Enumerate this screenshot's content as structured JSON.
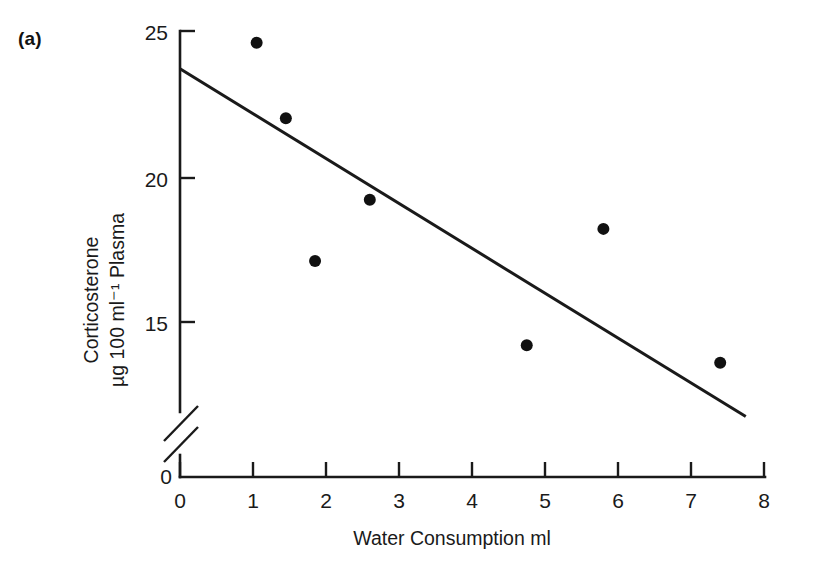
{
  "figure": {
    "panel_label": "(a)",
    "background_color": "#ffffff",
    "ink_color": "#1a1a1a"
  },
  "chart_data": {
    "type": "scatter",
    "title": "",
    "xlabel": "Water Consumption ml",
    "ylabel_line1": "Corticosterone",
    "ylabel_line2": "µg 100 ml⁻¹ Plasma",
    "xlim": [
      0,
      8
    ],
    "ylim": [
      0,
      25
    ],
    "y_axis_break": true,
    "y_break_between": [
      0,
      13
    ],
    "grid": false,
    "legend": null,
    "xticks": [
      0,
      1,
      2,
      3,
      4,
      5,
      6,
      7,
      8
    ],
    "xtick_labels": [
      "0",
      "1",
      "2",
      "3",
      "4",
      "5",
      "6",
      "7",
      "8"
    ],
    "yticks": [
      0,
      15,
      20,
      25
    ],
    "ytick_labels": [
      "0",
      "15",
      "20",
      "25"
    ],
    "x": [
      1.05,
      1.45,
      1.85,
      2.6,
      4.75,
      5.8,
      7.4
    ],
    "y": [
      24.6,
      22.0,
      17.1,
      19.2,
      14.2,
      18.2,
      13.6
    ],
    "points": [
      {
        "x": 1.05,
        "y": 24.6
      },
      {
        "x": 1.45,
        "y": 22.0
      },
      {
        "x": 1.85,
        "y": 17.1
      },
      {
        "x": 2.6,
        "y": 19.2
      },
      {
        "x": 4.75,
        "y": 14.2
      },
      {
        "x": 5.8,
        "y": 18.2
      },
      {
        "x": 7.4,
        "y": 13.6
      }
    ],
    "marker": "filled-circle",
    "marker_color": "#111111",
    "marker_size_px": 11,
    "trendline": {
      "type": "linear-fit",
      "x_start": 0.0,
      "y_start": 23.7,
      "x_end": 7.75,
      "y_end": 11.75,
      "color": "#1a1a1a"
    }
  }
}
